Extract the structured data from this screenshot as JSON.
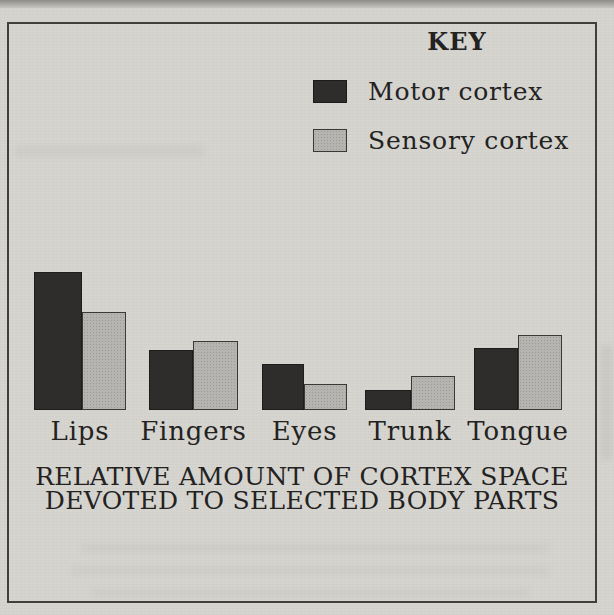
{
  "figure": {
    "key_title": "KEY",
    "legend": [
      {
        "label": "Motor cortex",
        "swatch": "motor-swatch"
      },
      {
        "label": "Sensory cortex",
        "swatch": "sensory-swatch"
      }
    ],
    "caption_line1": "RELATIVE AMOUNT OF CORTEX SPACE",
    "caption_line2": "DEVOTED TO SELECTED BODY PARTS"
  },
  "colors": {
    "paper": "#d6d4cf",
    "motor_cortex": "#2e2d2b",
    "sensory_cortex": "#b5b4b0",
    "frame_border": "#413f3b",
    "text": "#23221f"
  },
  "chart_data": {
    "type": "bar",
    "title": "RELATIVE AMOUNT OF CORTEX SPACE DEVOTED TO SELECTED BODY PARTS",
    "categories": [
      "Lips",
      "Fingers",
      "Eyes",
      "Trunk",
      "Tongue"
    ],
    "series": [
      {
        "name": "Motor cortex",
        "values": [
          138,
          60,
          46,
          20,
          62
        ]
      },
      {
        "name": "Sensory cortex",
        "values": [
          98,
          69,
          26,
          34,
          75
        ]
      }
    ],
    "value_units": "relative amount (no numeric axis shown; values proportional to bar heights)",
    "xlabel": "",
    "ylabel": "",
    "ylim": [
      0,
      150
    ],
    "grid": false,
    "legend_position": "top-right",
    "legend_title": "KEY"
  }
}
